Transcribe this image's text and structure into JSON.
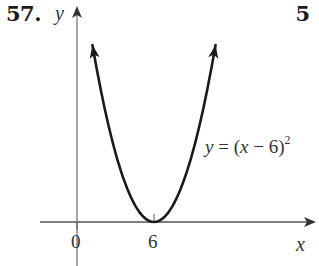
{
  "header": {
    "problem_number": "57.",
    "page_mark": "5"
  },
  "colors": {
    "curve": "#1a1a1a",
    "axes": "#555555",
    "text": "#333333"
  },
  "chart_data": {
    "type": "line",
    "title": "",
    "function": "y = (x - 6)^2",
    "annotation": {
      "prefix": "y",
      "equals": " = (",
      "var": "x",
      "rest": " − 6)",
      "exponent": "2"
    },
    "xlabel": "x",
    "ylabel": "y",
    "x_ticks": [
      {
        "value": 0,
        "label": "0"
      },
      {
        "value": 6,
        "label": "6"
      }
    ],
    "xlim": [
      -3,
      18
    ],
    "ylim": [
      -6,
      28
    ],
    "vertex": [
      6,
      0
    ],
    "series": [
      {
        "name": "y = (x - 6)^2",
        "x": [
          1.2,
          2,
          3,
          4,
          5,
          6,
          7,
          8,
          9,
          10,
          10.8
        ],
        "y": [
          23.04,
          16,
          9,
          4,
          1,
          0,
          1,
          4,
          9,
          16,
          23.04
        ],
        "arrows_both_ends": true
      }
    ],
    "grid": false,
    "legend": "none",
    "axes_with_arrows": true
  }
}
